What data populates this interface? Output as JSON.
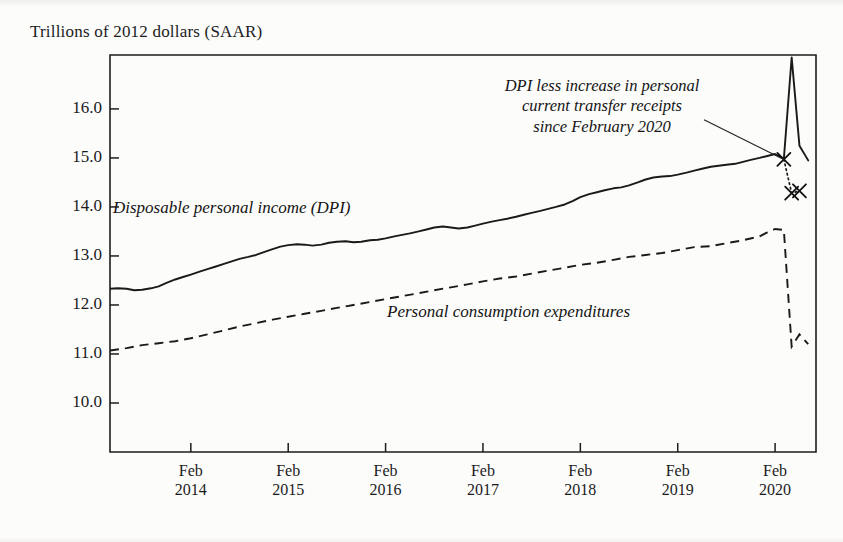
{
  "chart_data": {
    "type": "line",
    "title": "Trillions of 2012 dollars (SAAR)",
    "xlabel": "",
    "ylabel": "Trillions of 2012 dollars (SAAR)",
    "ylim": [
      9.0,
      17.1
    ],
    "yticks": [
      10.0,
      11.0,
      12.0,
      13.0,
      14.0,
      15.0,
      16.0
    ],
    "ytick_labels": [
      "10.0",
      "11.0",
      "12.0",
      "13.0",
      "14.0",
      "15.0",
      "16.0"
    ],
    "xlim": [
      2013.25,
      2020.5
    ],
    "xticks": [
      2014.08,
      2015.08,
      2016.08,
      2017.08,
      2018.08,
      2019.08,
      2020.08
    ],
    "xtick_labels": [
      {
        "month": "Feb",
        "year": "2014"
      },
      {
        "month": "Feb",
        "year": "2015"
      },
      {
        "month": "Feb",
        "year": "2016"
      },
      {
        "month": "Feb",
        "year": "2017"
      },
      {
        "month": "Feb",
        "year": "2018"
      },
      {
        "month": "Feb",
        "year": "2019"
      },
      {
        "month": "Feb",
        "year": "2020"
      }
    ],
    "grid": false,
    "legend_position": "inline-labels",
    "series": [
      {
        "name": "Disposable personal income (DPI)",
        "style": "solid",
        "color": "#1a1a1a",
        "x": [
          2013.25,
          2013.33,
          2013.42,
          2013.5,
          2013.58,
          2013.67,
          2013.75,
          2013.83,
          2013.92,
          2014.0,
          2014.08,
          2014.17,
          2014.25,
          2014.33,
          2014.42,
          2014.5,
          2014.58,
          2014.67,
          2014.75,
          2014.83,
          2014.92,
          2015.0,
          2015.08,
          2015.17,
          2015.25,
          2015.33,
          2015.42,
          2015.5,
          2015.58,
          2015.67,
          2015.75,
          2015.83,
          2015.92,
          2016.0,
          2016.08,
          2016.17,
          2016.25,
          2016.33,
          2016.42,
          2016.5,
          2016.58,
          2016.67,
          2016.75,
          2016.83,
          2016.92,
          2017.0,
          2017.08,
          2017.17,
          2017.25,
          2017.33,
          2017.42,
          2017.5,
          2017.58,
          2017.67,
          2017.75,
          2017.83,
          2017.92,
          2018.0,
          2018.08,
          2018.17,
          2018.25,
          2018.33,
          2018.42,
          2018.5,
          2018.58,
          2018.67,
          2018.75,
          2018.83,
          2018.92,
          2019.0,
          2019.08,
          2019.17,
          2019.25,
          2019.33,
          2019.42,
          2019.5,
          2019.58,
          2019.67,
          2019.75,
          2019.83,
          2019.92,
          2020.0,
          2020.08,
          2020.17,
          2020.25,
          2020.33,
          2020.42
        ],
        "values": [
          12.33,
          12.34,
          12.33,
          12.3,
          12.31,
          12.34,
          12.38,
          12.45,
          12.52,
          12.57,
          12.62,
          12.68,
          12.73,
          12.78,
          12.84,
          12.89,
          12.94,
          12.98,
          13.02,
          13.08,
          13.14,
          13.19,
          13.22,
          13.24,
          13.23,
          13.21,
          13.23,
          13.27,
          13.29,
          13.3,
          13.28,
          13.29,
          13.32,
          13.33,
          13.36,
          13.4,
          13.43,
          13.46,
          13.5,
          13.54,
          13.58,
          13.6,
          13.58,
          13.56,
          13.58,
          13.62,
          13.66,
          13.7,
          13.73,
          13.76,
          13.8,
          13.84,
          13.88,
          13.92,
          13.96,
          14.0,
          14.05,
          14.12,
          14.2,
          14.26,
          14.3,
          14.34,
          14.38,
          14.4,
          14.44,
          14.5,
          14.56,
          14.6,
          14.62,
          14.63,
          14.66,
          14.7,
          14.74,
          14.78,
          14.82,
          14.84,
          14.86,
          14.88,
          14.92,
          14.96,
          15.0,
          15.04,
          15.08,
          14.98,
          17.05,
          15.25,
          14.95
        ]
      },
      {
        "name": "Personal consumption expenditures",
        "style": "dashed",
        "color": "#1a1a1a",
        "x": [
          2013.25,
          2013.42,
          2013.58,
          2013.75,
          2013.92,
          2014.08,
          2014.25,
          2014.42,
          2014.58,
          2014.75,
          2014.92,
          2015.08,
          2015.25,
          2015.42,
          2015.58,
          2015.75,
          2015.92,
          2016.08,
          2016.25,
          2016.42,
          2016.58,
          2016.75,
          2016.92,
          2017.08,
          2017.25,
          2017.42,
          2017.58,
          2017.75,
          2017.92,
          2018.08,
          2018.25,
          2018.42,
          2018.58,
          2018.75,
          2018.92,
          2019.08,
          2019.25,
          2019.42,
          2019.58,
          2019.75,
          2019.92,
          2020.0,
          2020.08,
          2020.17,
          2020.25,
          2020.33,
          2020.42
        ],
        "values": [
          11.07,
          11.12,
          11.18,
          11.22,
          11.26,
          11.32,
          11.4,
          11.48,
          11.56,
          11.63,
          11.7,
          11.76,
          11.82,
          11.88,
          11.94,
          12.0,
          12.06,
          12.12,
          12.18,
          12.24,
          12.3,
          12.36,
          12.42,
          12.48,
          12.54,
          12.58,
          12.64,
          12.7,
          12.76,
          12.82,
          12.86,
          12.92,
          12.98,
          13.02,
          13.06,
          13.12,
          13.18,
          13.2,
          13.26,
          13.32,
          13.4,
          13.48,
          13.55,
          13.53,
          11.15,
          11.4,
          11.2
        ]
      },
      {
        "name": "DPI less increase in personal current transfer receipts since February 2020",
        "style": "dotted",
        "color": "#1a1a1a",
        "x": [
          2020.17,
          2020.25,
          2020.33
        ],
        "values": [
          14.97,
          14.28,
          14.33
        ],
        "markers": "x"
      }
    ],
    "markers": [
      {
        "x": 2020.17,
        "y": 14.97,
        "symbol": "x"
      },
      {
        "x": 2020.25,
        "y": 14.28,
        "symbol": "x"
      },
      {
        "x": 2020.33,
        "y": 14.33,
        "symbol": "x"
      }
    ],
    "annotations": [
      {
        "id": "transfer-annotation",
        "lines": [
          "DPI less increase in personal",
          "current transfer receipts",
          "since February 2020"
        ],
        "style": "italic",
        "leader_from": [
          2019.35,
          15.78
        ],
        "leader_to": [
          2020.17,
          14.97
        ]
      },
      {
        "id": "dpi-label",
        "text": "Disposable personal income (DPI)",
        "style": "italic"
      },
      {
        "id": "pce-label",
        "text": "Personal consumption expenditures",
        "style": "italic"
      }
    ]
  },
  "axes": {
    "title": "Trillions of 2012 dollars (SAAR)",
    "y_labels": [
      "16.0",
      "15.0",
      "14.0",
      "13.0",
      "12.0",
      "11.0",
      "10.0"
    ],
    "x_labels": [
      {
        "month": "Feb",
        "year": "2014"
      },
      {
        "month": "Feb",
        "year": "2015"
      },
      {
        "month": "Feb",
        "year": "2016"
      },
      {
        "month": "Feb",
        "year": "2017"
      },
      {
        "month": "Feb",
        "year": "2018"
      },
      {
        "month": "Feb",
        "year": "2019"
      },
      {
        "month": "Feb",
        "year": "2020"
      }
    ]
  },
  "labels": {
    "dpi": "Disposable personal income (DPI)",
    "pce": "Personal consumption expenditures",
    "annotation_line1": "DPI less increase in personal",
    "annotation_line2": "current transfer receipts",
    "annotation_line3": "since February 2020"
  },
  "colors": {
    "ink": "#1a1a1a",
    "paper": "#fcfcfb"
  }
}
